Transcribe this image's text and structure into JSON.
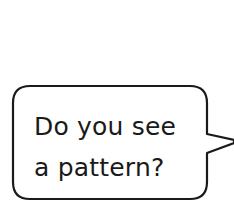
{
  "speech_bubble": {
    "lines": [
      "Do you see",
      "a pattern?"
    ],
    "text_color": "#1a1a1a",
    "border_color": "#1a1a1a",
    "fill_color": "#ffffff"
  }
}
